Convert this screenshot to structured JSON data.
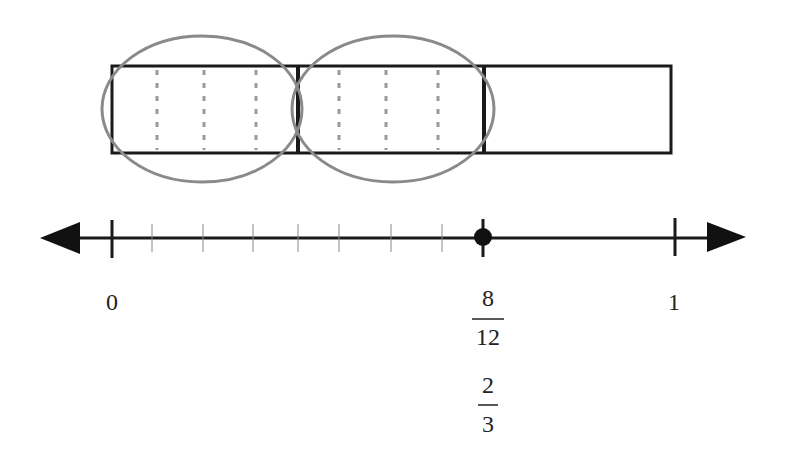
{
  "diagram": {
    "bar": {
      "parts": 3,
      "subdivisions_per_part": 4,
      "circled_groups": 2
    },
    "number_line": {
      "start_label": "0",
      "end_label": "1",
      "point": {
        "fraction1": {
          "numerator": "8",
          "denominator": "12"
        },
        "fraction2": {
          "numerator": "2",
          "denominator": "3"
        }
      },
      "minor_ticks": 12
    },
    "colors": {
      "line": "#1a1a1a",
      "circle": "#8a8a8a",
      "dashed": "#9a9a9a"
    }
  }
}
